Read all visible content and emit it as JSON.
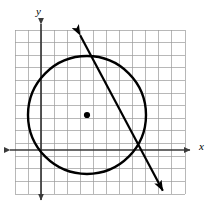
{
  "figure": {
    "type": "geometry-diagram",
    "background_color": "#ffffff",
    "ink_color": "#000000",
    "grid_color": "#9a9a9a",
    "axis_color": "#3a3a3a"
  },
  "axes": {
    "x_label": "x",
    "y_label": "y",
    "x_axis": {
      "y_px": 150,
      "x_start_px": 4,
      "x_end_px": 196,
      "arrows": "both"
    },
    "y_axis": {
      "x_px": 41,
      "y_start_px": 18,
      "y_end_px": 206,
      "arrows": "both"
    }
  },
  "grid": {
    "left_px": 15,
    "top_px": 30,
    "right_px": 185,
    "bottom_px": 194,
    "columns": 13,
    "rows": 13,
    "cell_width_px": 13.08,
    "cell_height_px": 12.62,
    "line_width_px": 0.7
  },
  "chart_data": {
    "type": "scatter",
    "title": "",
    "xlabel": "x",
    "ylabel": "y",
    "grid": true,
    "legend": "none",
    "shapes": [
      {
        "name": "circle",
        "kind": "circle",
        "center_px": [
          87,
          115
        ],
        "radius_px": 59,
        "stroke_px": 2.4,
        "fill": "none"
      },
      {
        "name": "center-point",
        "kind": "point",
        "center_px": [
          87,
          115
        ],
        "radius_px": 3.1,
        "fill": "#000000"
      },
      {
        "name": "secant-line",
        "kind": "double-arrow-line",
        "start_px": [
          79,
          33
        ],
        "end_px": [
          164,
          193
        ],
        "stroke_px": 2.2,
        "arrow_head_length_px": 11,
        "arrow_head_width_px": 7
      }
    ]
  }
}
